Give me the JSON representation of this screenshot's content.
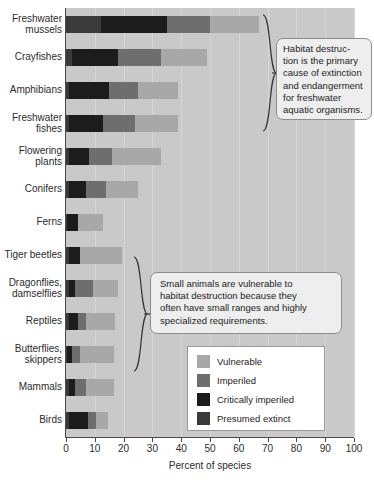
{
  "chart_data": {
    "type": "bar",
    "orientation": "horizontal",
    "stacked": true,
    "title": "",
    "xlabel": "Percent of species",
    "ylabel": "",
    "xlim": [
      0,
      100
    ],
    "xticks": [
      0,
      10,
      20,
      30,
      40,
      50,
      60,
      70,
      80,
      90,
      100
    ],
    "grid": "vertical",
    "legend_position": "inside-lower-right",
    "categories": [
      "Freshwater mussels",
      "Crayfishes",
      "Amphibians",
      "Freshwater fishes",
      "Flowering plants",
      "Conifers",
      "Ferns",
      "Tiger beetles",
      "Dragonflies, damselflies",
      "Reptiles",
      "Butterflies, skippers",
      "Mammals",
      "Birds"
    ],
    "series": [
      {
        "name": "Presumed extinct",
        "color": "#3a3a3a",
        "values": [
          12,
          2,
          1,
          1,
          1,
          1,
          0.5,
          1,
          1,
          1,
          0.5,
          1,
          1
        ]
      },
      {
        "name": "Critically imperiled",
        "color": "#1c1c1c",
        "values": [
          23,
          16,
          14,
          12,
          7,
          6,
          3.5,
          4,
          2,
          3,
          1.5,
          2,
          6.5
        ]
      },
      {
        "name": "Imperiled",
        "color": "#6e6e6e",
        "values": [
          15,
          15,
          10,
          11,
          8,
          7,
          0,
          0,
          6.5,
          3,
          3,
          4,
          3
        ]
      },
      {
        "name": "Vulnerable",
        "color": "#a8a8a8",
        "values": [
          17,
          16,
          14,
          15,
          17,
          11,
          9,
          14.5,
          8.5,
          10,
          11.5,
          9.5,
          4
        ]
      }
    ],
    "totals": [
      67,
      49,
      39,
      39,
      33,
      25,
      13,
      19.5,
      18,
      17,
      16.5,
      16.5,
      14.5
    ]
  },
  "axis": {
    "xlabel": "Percent of species",
    "xtick_labels": [
      "0",
      "10",
      "20",
      "30",
      "40",
      "50",
      "60",
      "70",
      "80",
      "90",
      "100"
    ]
  },
  "legend": {
    "items": [
      {
        "label": "Vulnerable",
        "color": "#a8a8a8",
        "swatch_name": "swatch-vulnerable"
      },
      {
        "label": "Imperiled",
        "color": "#6e6e6e",
        "swatch_name": "swatch-imperiled"
      },
      {
        "label": "Critically imperiled",
        "color": "#1c1c1c",
        "swatch_name": "swatch-critically-imperiled"
      },
      {
        "label": "Presumed extinct",
        "color": "#3a3a3a",
        "swatch_name": "swatch-presumed-extinct"
      }
    ]
  },
  "callouts": {
    "top": {
      "lines": [
        "Habitat destruc-",
        "tion is the primary",
        "cause of extinction",
        "and endangerment",
        "for freshwater",
        "aquatic organisms."
      ]
    },
    "bottom": {
      "lines": [
        "Small animals are vulnerable to",
        "habitat destruction because they",
        "often have small ranges and highly",
        "specialized requirements."
      ]
    }
  },
  "colors": {
    "plot_background": "#c9c9c9",
    "gridline": "#d6d6d6",
    "axis": "#4a4a4a",
    "callout_background": "#eeeeee",
    "callout_border": "#8e8e8e",
    "legend_background": "#ffffff"
  }
}
